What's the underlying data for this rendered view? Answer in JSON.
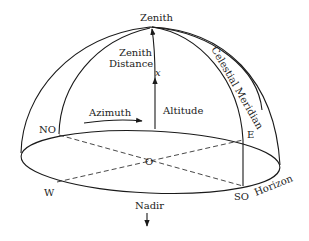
{
  "diagram": {
    "labels": {
      "zenith": "Zenith",
      "zenith_distance_line1": "Zenith",
      "zenith_distance_line2": "Distance",
      "x_symbol": "x",
      "celestial_meridian": "Celestial Meridian",
      "azimuth": "Azimuth",
      "altitude": "Altitude",
      "no": "NO",
      "e": "E",
      "o": "O",
      "w": "W",
      "so": "SO",
      "horizon": "Horizon",
      "nadir": "Nadir"
    },
    "colors": {
      "line": "#1a1a1a",
      "text": "#222222",
      "background": "#ffffff"
    }
  }
}
